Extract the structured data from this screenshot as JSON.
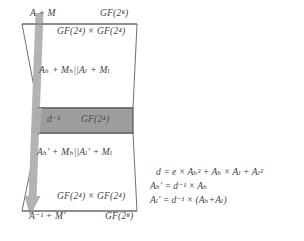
{
  "figure": {
    "colors": {
      "outline": "#5a5a5a",
      "box_fill": "#9d9d9d",
      "box_stroke": "#4a4a4a",
      "arrow": "#b0b0b0",
      "text": "#444444",
      "background": "#ffffff"
    },
    "labels": {
      "top_left": "A + M",
      "top_right_field": "GF(2",
      "top_right_field_sup": "8",
      "top_right_field_close": ")",
      "upper_field": "GF(2⁴) × GF(2⁴)",
      "upper_split": "Aₕ + Mₕ||Aₗ + Mₗ",
      "inverse": "d⁻¹",
      "gf4": "GF(2⁴)",
      "lower_split": "Aₕ' + Mₕ||Aₗ' + Mₗ",
      "lower_field": "GF(2⁴) × GF(2⁴)",
      "bottom_left": "A⁻¹ + M'",
      "bottom_right": "GF(2⁸)"
    },
    "equations": [
      "d = e × Aₕ² + Aₕ × Aₗ + Aₗ²",
      "Aₕ' = d⁻¹ × Aₕ",
      "Aₗ' = d⁻¹ × (Aₕ+Aₗ)"
    ],
    "shapes": {
      "upper_trapezoid": "isosceles trapezoid, wide top narrowing downward",
      "middle_box": "filled gray rectangle labelled d^-1 GF(2^4)",
      "lower_trapezoid": "isosceles trapezoid, narrow top widening downward",
      "arrow": "thick gray arrow from top-left down through the middle box to bottom-left"
    }
  }
}
